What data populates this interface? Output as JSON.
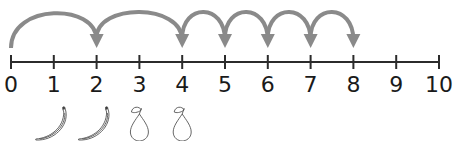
{
  "number_line": {
    "min": 0,
    "max": 10,
    "labels": [
      "0",
      "1",
      "2",
      "3",
      "4",
      "5",
      "6",
      "7",
      "8",
      "9",
      "10"
    ],
    "line_color": "#2b2b2b"
  },
  "jumps": {
    "color": "#8a8a8a",
    "items": [
      {
        "from": 0,
        "to": 2
      },
      {
        "from": 2,
        "to": 4
      },
      {
        "from": 4,
        "to": 5
      },
      {
        "from": 5,
        "to": 6
      },
      {
        "from": 6,
        "to": 7
      },
      {
        "from": 7,
        "to": 8
      }
    ]
  },
  "fruits": [
    {
      "type": "banana",
      "under": 1
    },
    {
      "type": "banana",
      "under": 2
    },
    {
      "type": "pear",
      "under": 3
    },
    {
      "type": "pear",
      "under": 4
    }
  ]
}
